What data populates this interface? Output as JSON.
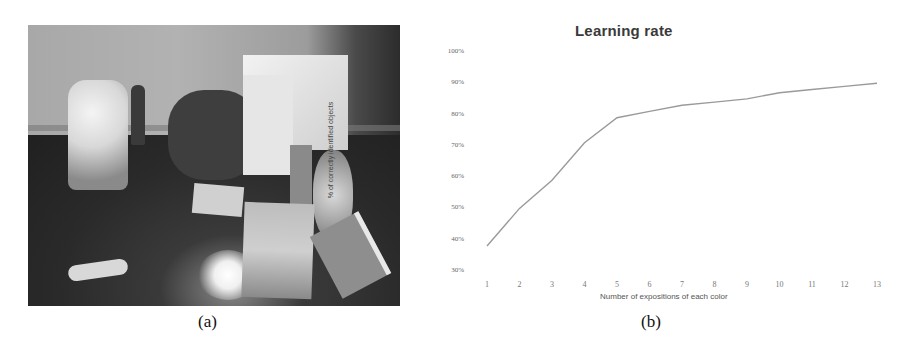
{
  "figure": {
    "panel_a": {
      "caption": "(a)",
      "description": "Photo of a table scene with a humanoid robot and various colored objects"
    },
    "panel_b": {
      "caption": "(b)"
    }
  },
  "chart_data": {
    "type": "line",
    "title": "Learning rate",
    "xlabel": "Number of expositions of each color",
    "ylabel": "% of correctly identified objects",
    "x": [
      1,
      2,
      3,
      4,
      5,
      6,
      7,
      8,
      9,
      10,
      11,
      12,
      13
    ],
    "categories": [
      "1",
      "2",
      "3",
      "4",
      "5",
      "6",
      "7",
      "8",
      "9",
      "10",
      "11",
      "12",
      "13"
    ],
    "series": [
      {
        "name": "Learning rate",
        "values": [
          38,
          50,
          59,
          71,
          79,
          81,
          83,
          84,
          85,
          87,
          88,
          89,
          90
        ],
        "color": "#9a9a9a"
      }
    ],
    "y_ticks": [
      "30%",
      "40%",
      "50%",
      "60%",
      "70%",
      "80%",
      "90%",
      "100%"
    ],
    "ylim": [
      30,
      100
    ],
    "grid": false,
    "legend": "none"
  }
}
